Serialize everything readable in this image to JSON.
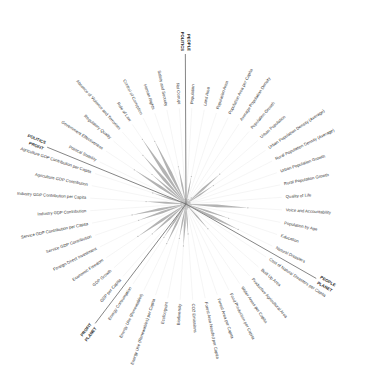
{
  "chart_data": {
    "type": "radar",
    "title": "",
    "grid": false,
    "rmax": 1.0,
    "fill_color": "#b3b3b3",
    "spoke_color": "#eeeeee",
    "divider_color": "#666666",
    "text_color": "#333333",
    "categories": [
      "Population",
      "Land Area",
      "Population Area",
      "Population Area per Capita",
      "Average Population Density",
      "Population Growth",
      "Urban Population",
      "Urban Population Density (Average)",
      "Rural Population Density (Average)",
      "Urban Population Growth",
      "Rural Population Growth",
      "Quality of Life",
      "Voice and Accountability",
      "Population by Age",
      "Education",
      "Natural Disasters",
      "Cost of Natural Disasters per Capita",
      "Built Up Area",
      "Productive Agricultural Area",
      "Water Areas per Capita",
      "Food Production per Capita",
      "Forest Area per Capita",
      "Forest Area Needed per Capita",
      "CO2 Emissions",
      "Biodiversity",
      "Ecofootprint",
      "Energy Use (Renewables) per Capita",
      "Energy Use (Renewables)",
      "Energy Consumption",
      "GDP per Capita",
      "GDP Growth",
      "Economic Freedom",
      "Foreign Direct Investment",
      "Service GDP Contribution",
      "Service GDP Contribution per Capita",
      "Industry GDP Contribution",
      "Industry GDP Contribution per Capita",
      "Agriculture GDP Contribution",
      "Agriculture GDP Contribution per Capita",
      "Political Stability",
      "Government Effectiveness",
      "Regulatory Quality",
      "Absence of Violence and Terrorism",
      "Rule of Law",
      "Control of Corruption",
      "Human Rights",
      "Safety and Security",
      "Not Corrupt"
    ],
    "values": [
      0.02,
      0.28,
      0.04,
      0.05,
      0.03,
      0.08,
      0.45,
      0.33,
      0.03,
      0.04,
      0.04,
      0.03,
      0.62,
      0.05,
      0.45,
      0.58,
      0.04,
      0.05,
      0.33,
      0.04,
      0.03,
      0.04,
      0.05,
      0.3,
      0.42,
      0.35,
      0.05,
      0.44,
      0.4,
      0.05,
      0.45,
      0.58,
      0.05,
      0.5,
      0.55,
      0.05,
      0.4,
      0.05,
      0.35,
      0.05,
      0.62,
      0.45,
      0.65,
      0.78,
      0.7,
      0.05,
      0.38,
      0.05
    ],
    "groups": [
      {
        "label_a": "POLITICS",
        "label_b": "PEOPLE",
        "boundary_index": 0
      },
      {
        "label_a": "PEOPLE",
        "label_b": "PLANET",
        "boundary_index": 16
      },
      {
        "label_a": "PLANET",
        "label_b": "PROFIT",
        "boundary_index": 29
      },
      {
        "label_a": "PROFIT",
        "label_b": "POLITICS",
        "boundary_index": 39
      }
    ]
  }
}
